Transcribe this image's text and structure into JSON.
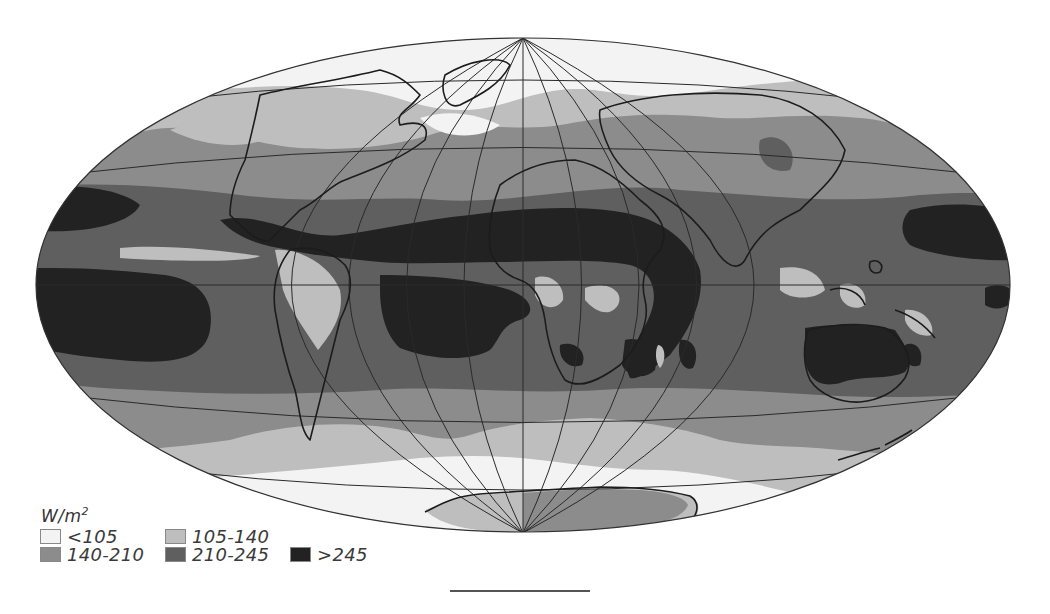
{
  "map": {
    "title": "",
    "projection": "Hammer-Aitoff (elliptical world map)",
    "variable": "Absorbed / net radiation (W/m²)",
    "colors": {
      "lt105": "#f3f3f3",
      "r105_140": "#bebebe",
      "r140_210": "#8c8c8c",
      "r210_245": "#5f5f5f",
      "gt245": "#222222",
      "coast": "#1c1c1c",
      "graticule": "#2a2a2a"
    }
  },
  "legend": {
    "unit": "W/m",
    "unit_exp": "2",
    "items": [
      {
        "label": "<105",
        "color": "#f3f3f3"
      },
      {
        "label": "105-140",
        "color": "#bebebe"
      },
      {
        "label": "140-210",
        "color": "#8c8c8c"
      },
      {
        "label": "210-245",
        "color": "#5f5f5f"
      },
      {
        "label": ">245",
        "color": "#222222"
      }
    ]
  }
}
